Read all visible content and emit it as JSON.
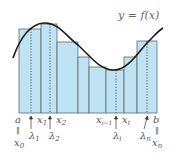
{
  "title_label": "y = f(x)",
  "colors": {
    "bar_fill": "#bfe3f3",
    "bar_stroke": "#5a6a70",
    "curve": "#1a1a1a",
    "dotted": "#2a3a50",
    "text": "#555555"
  },
  "chart_data": {
    "type": "diagram",
    "curve_label": "y = f(x)",
    "bars": [
      {
        "x0": 19,
        "x1": 41,
        "top": 29
      },
      {
        "x0": 41,
        "x1": 57,
        "top": 24
      },
      {
        "x0": 57,
        "x1": 78,
        "top": 42
      },
      {
        "x0": 78,
        "x1": 89,
        "top": 57
      },
      {
        "x0": 89,
        "x1": 106,
        "top": 67
      },
      {
        "x0": 106,
        "x1": 124,
        "top": 70
      },
      {
        "x0": 124,
        "x1": 137,
        "top": 57
      },
      {
        "x0": 137,
        "x1": 157,
        "top": 41
      }
    ],
    "sample_points": [
      31,
      50,
      116,
      147
    ],
    "labels": {
      "a": "a",
      "x0": "x",
      "x0_sub": "0",
      "x1": "x",
      "x1_sub": "1",
      "x2": "x",
      "x2_sub": "2",
      "xi_minus_1": "x",
      "xi_minus_1_sub": "i−1",
      "xi": "x",
      "xi_sub": "i",
      "b": "b",
      "xn": "x",
      "xn_sub": "n",
      "lambda1": "λ",
      "lambda1_sub": "1",
      "lambda2": "λ",
      "lambda2_sub": "2",
      "lambdai": "λ",
      "lambdai_sub": "i",
      "lambdan": "λ",
      "lambdan_sub": "n",
      "equals_vertical": "‖"
    }
  }
}
